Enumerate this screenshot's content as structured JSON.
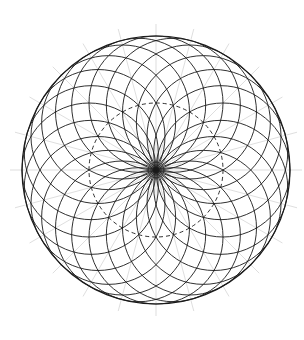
{
  "figure": {
    "type": "circle-rosette-construction",
    "center": [
      156,
      170
    ],
    "center_circle_radius": 67,
    "circle_count": 24,
    "outer_radius": 134,
    "colors": {
      "stroke": "#1a1a1a",
      "guide": "#c8c8c8",
      "background": "#ffffff"
    }
  }
}
